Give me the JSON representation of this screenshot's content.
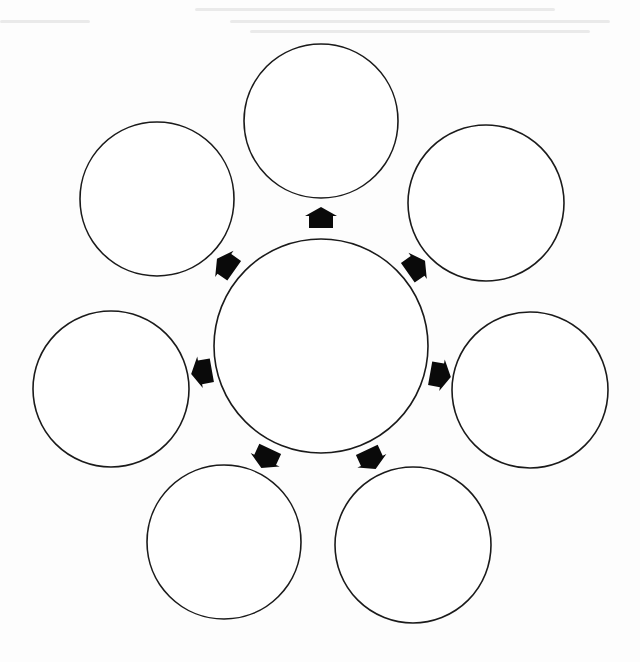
{
  "diagram": {
    "type": "graphic-organizer-radial",
    "colors": {
      "stroke": "#1a1a1a",
      "arrow": "#0a0a0a",
      "fill": "#ffffff",
      "background": "#fdfdfd"
    },
    "center": {
      "id": "center",
      "cx": 321,
      "cy": 346,
      "r": 107,
      "label": ""
    },
    "outer_nodes": [
      {
        "id": "top",
        "cx": 321,
        "cy": 121,
        "r": 77,
        "label": ""
      },
      {
        "id": "upper-right",
        "cx": 486,
        "cy": 203,
        "r": 78,
        "label": ""
      },
      {
        "id": "right",
        "cx": 530,
        "cy": 390,
        "r": 78,
        "label": ""
      },
      {
        "id": "lower-right",
        "cx": 413,
        "cy": 545,
        "r": 78,
        "label": ""
      },
      {
        "id": "lower-left",
        "cx": 224,
        "cy": 542,
        "r": 77,
        "label": ""
      },
      {
        "id": "left",
        "cx": 111,
        "cy": 389,
        "r": 78,
        "label": ""
      },
      {
        "id": "upper-left",
        "cx": 157,
        "cy": 199,
        "r": 77,
        "label": ""
      }
    ],
    "arrows": [
      {
        "id": "arrow-top",
        "x": 321,
        "y": 218,
        "angle": 0,
        "target": "top"
      },
      {
        "id": "arrow-upper-right",
        "x": 416,
        "y": 267,
        "angle": 55,
        "target": "upper-right"
      },
      {
        "id": "arrow-right",
        "x": 440,
        "y": 375,
        "angle": 100,
        "target": "right"
      },
      {
        "id": "arrow-lower-right",
        "x": 371,
        "y": 459,
        "angle": 155,
        "target": "lower-right"
      },
      {
        "id": "arrow-lower-left",
        "x": 266,
        "y": 458,
        "angle": -155,
        "target": "lower-left"
      },
      {
        "id": "arrow-left",
        "x": 202,
        "y": 372,
        "angle": -100,
        "target": "left"
      },
      {
        "id": "arrow-upper-left",
        "x": 226,
        "y": 265,
        "angle": -55,
        "target": "upper-left"
      }
    ]
  }
}
